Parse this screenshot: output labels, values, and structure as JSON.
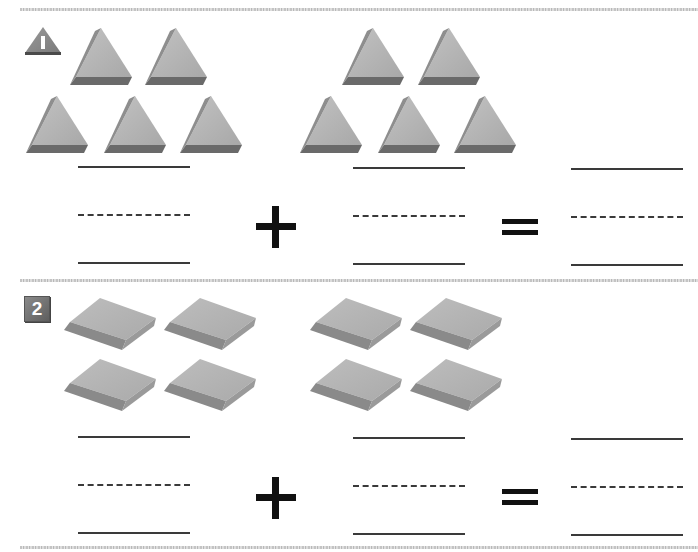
{
  "worksheet": {
    "problems": [
      {
        "number": "1",
        "badge_shape": "triangle",
        "shape_type": "triangle-prism",
        "group_a_count": 5,
        "group_b_count": 5,
        "operator": "+",
        "equals": "=",
        "answer_blanks": [
          "",
          "",
          ""
        ]
      },
      {
        "number": "2",
        "badge_shape": "square",
        "shape_type": "rhombus-tile",
        "group_a_count": 4,
        "group_b_count": 4,
        "operator": "+",
        "equals": "=",
        "answer_blanks": [
          "",
          "",
          ""
        ]
      }
    ]
  },
  "colors": {
    "shape_face": "#b5b5b5",
    "shape_side": "#6e6e6e",
    "badge": "#7a7a7a",
    "ink": "#111111"
  }
}
